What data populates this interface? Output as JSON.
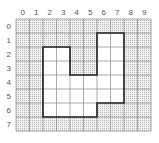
{
  "grid": {
    "columns": [
      "0",
      "1",
      "2",
      "3",
      "4",
      "5",
      "6",
      "7",
      "8",
      "9"
    ],
    "rows": [
      "0",
      "1",
      "2",
      "3",
      "4",
      "5",
      "6",
      "7"
    ],
    "shaded_fill": "#d9d9d9",
    "line_color": "#888888",
    "shape_outline_color": "#222222"
  },
  "shape": {
    "description": "Outlined unshaded region on grid",
    "vertices": [
      [
        2,
        2
      ],
      [
        4,
        2
      ],
      [
        4,
        4
      ],
      [
        6,
        4
      ],
      [
        6,
        1
      ],
      [
        8,
        1
      ],
      [
        8,
        6
      ],
      [
        6,
        6
      ],
      [
        6,
        7
      ],
      [
        2,
        7
      ]
    ]
  }
}
